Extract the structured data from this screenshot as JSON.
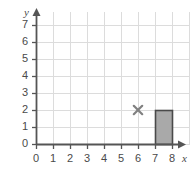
{
  "chart_data": {
    "type": "scatter",
    "title": "",
    "xlabel": "x",
    "ylabel": "y",
    "xlim": [
      0,
      8
    ],
    "ylim": [
      0,
      7
    ],
    "grid": true,
    "legend": false,
    "x_ticks": [
      "0",
      "1",
      "2",
      "3",
      "4",
      "5",
      "6",
      "7",
      "8"
    ],
    "y_ticks": [
      "0",
      "1",
      "2",
      "3",
      "4",
      "5",
      "6",
      "7"
    ],
    "x_tick_values": [
      0,
      1,
      2,
      3,
      4,
      5,
      6,
      7,
      8
    ],
    "y_tick_values": [
      0,
      1,
      2,
      3,
      4,
      5,
      6,
      7
    ],
    "markers": [
      {
        "label": "x-marker",
        "symbol": "×",
        "x": 6,
        "y": 2,
        "color": "#808080"
      }
    ],
    "rectangles": [
      {
        "label": "shaded-rectangle",
        "x0": 7,
        "y0": 0,
        "x1": 8,
        "y1": 2,
        "fill": "#a9a9a9",
        "stroke": "#4a4a4a"
      }
    ]
  },
  "style": {
    "grid_color": "#dcdcdc",
    "axis_color": "#555555",
    "tick_text_color": "#4a4a4a",
    "background": "#ffffff"
  },
  "geometry": {
    "origin_x": 36,
    "origin_y": 144,
    "cell_w": 17,
    "cell_h": 17,
    "grid_top": 12,
    "grid_right": 190
  }
}
